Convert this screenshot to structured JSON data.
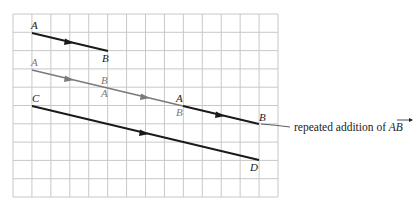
{
  "diagram": {
    "grid": {
      "cols": 14,
      "rows": 10,
      "left": 13,
      "top": 14,
      "right": 278,
      "bottom": 197,
      "line_color": "#c8c8c8"
    },
    "colors": {
      "dark": "#1a1a1a",
      "gray": "#7a7a7a"
    },
    "vectors": {
      "ab": {
        "start_label": "A",
        "end_label": "B"
      },
      "repeated": {
        "labels": [
          "A",
          "B",
          "A",
          "A",
          "B",
          "B"
        ]
      },
      "cd": {
        "start_label": "C",
        "end_label": "D"
      }
    },
    "annotation": {
      "text": "repeated addition of ",
      "vector_name": "AB"
    }
  }
}
